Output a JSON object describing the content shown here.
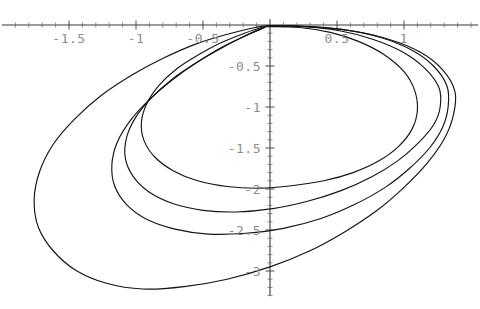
{
  "figure": {
    "width": 480,
    "height": 309,
    "background": "#ffffff",
    "curve_color": "#141414",
    "axis_color": "#3a3a3a",
    "label_color": "#8d8d8d"
  },
  "chart_data": {
    "type": "line",
    "title": "",
    "subtitle": "",
    "xlabel": "",
    "ylabel": "",
    "grid": false,
    "legend": "none",
    "axes_style": "cross-at-origin",
    "xlim": [
      -1.95,
      1.6
    ],
    "ylim": [
      -3.35,
      0.18
    ],
    "xticks": [
      -1.5,
      -1,
      -0.5,
      0.5,
      1
    ],
    "xtick_labels": [
      "-1.5",
      "-1",
      "-0.5",
      "0.5",
      "1"
    ],
    "yticks": [
      -0.5,
      -1,
      -1.5,
      -2,
      -2.5,
      -3
    ],
    "ytick_labels": [
      "-0.5",
      "-1",
      "-1.5",
      "-2",
      "-2.5",
      "-3"
    ],
    "xtick_minor_step": 0.1,
    "ytick_minor_step": 0.1,
    "origin_px": [
      270,
      25
    ],
    "px_per_x_unit": 134,
    "px_per_y_unit": 82,
    "series": [
      {
        "name": "curve-1-innermost",
        "closed": true,
        "min_y": -2.0,
        "max_y": 0.0,
        "min_x": -0.95,
        "max_x": 1.1,
        "points": [
          [
            0.0,
            -0.02
          ],
          [
            0.22,
            -0.03
          ],
          [
            0.45,
            -0.09
          ],
          [
            0.66,
            -0.2
          ],
          [
            0.85,
            -0.36
          ],
          [
            1.0,
            -0.57
          ],
          [
            1.08,
            -0.8
          ],
          [
            1.1,
            -1.04
          ],
          [
            1.06,
            -1.27
          ],
          [
            0.96,
            -1.48
          ],
          [
            0.81,
            -1.66
          ],
          [
            0.62,
            -1.8
          ],
          [
            0.4,
            -1.9
          ],
          [
            0.16,
            -1.96
          ],
          [
            -0.08,
            -1.99
          ],
          [
            -0.32,
            -1.97
          ],
          [
            -0.54,
            -1.9
          ],
          [
            -0.72,
            -1.78
          ],
          [
            -0.86,
            -1.61
          ],
          [
            -0.94,
            -1.41
          ],
          [
            -0.96,
            -1.19
          ],
          [
            -0.92,
            -0.96
          ],
          [
            -0.83,
            -0.74
          ],
          [
            -0.7,
            -0.54
          ],
          [
            -0.54,
            -0.37
          ],
          [
            -0.37,
            -0.22
          ],
          [
            -0.19,
            -0.1
          ],
          [
            -0.06,
            -0.03
          ],
          [
            0.0,
            -0.02
          ]
        ]
      },
      {
        "name": "curve-2",
        "closed": true,
        "min_y": -2.28,
        "max_y": 0.0,
        "min_x": -1.08,
        "max_x": 1.27,
        "points": [
          [
            0.0,
            -0.01
          ],
          [
            0.26,
            -0.02
          ],
          [
            0.52,
            -0.07
          ],
          [
            0.76,
            -0.17
          ],
          [
            0.98,
            -0.32
          ],
          [
            1.15,
            -0.52
          ],
          [
            1.26,
            -0.76
          ],
          [
            1.27,
            -1.0
          ],
          [
            1.22,
            -1.22
          ],
          [
            1.1,
            -1.45
          ],
          [
            0.95,
            -1.66
          ],
          [
            0.76,
            -1.85
          ],
          [
            0.53,
            -2.02
          ],
          [
            0.28,
            -2.15
          ],
          [
            0.02,
            -2.24
          ],
          [
            -0.25,
            -2.28
          ],
          [
            -0.5,
            -2.26
          ],
          [
            -0.72,
            -2.18
          ],
          [
            -0.9,
            -2.04
          ],
          [
            -1.02,
            -1.85
          ],
          [
            -1.08,
            -1.62
          ],
          [
            -1.07,
            -1.37
          ],
          [
            -1.0,
            -1.12
          ],
          [
            -0.88,
            -0.88
          ],
          [
            -0.73,
            -0.66
          ],
          [
            -0.55,
            -0.46
          ],
          [
            -0.37,
            -0.28
          ],
          [
            -0.18,
            -0.13
          ],
          [
            -0.05,
            -0.04
          ],
          [
            0.0,
            -0.01
          ]
        ]
      },
      {
        "name": "curve-3",
        "closed": true,
        "min_y": -2.55,
        "max_y": 0.0,
        "min_x": -1.18,
        "max_x": 1.33,
        "points": [
          [
            0.0,
            -0.01
          ],
          [
            0.28,
            -0.02
          ],
          [
            0.56,
            -0.06
          ],
          [
            0.82,
            -0.15
          ],
          [
            1.05,
            -0.3
          ],
          [
            1.22,
            -0.5
          ],
          [
            1.32,
            -0.74
          ],
          [
            1.33,
            -0.99
          ],
          [
            1.29,
            -1.24
          ],
          [
            1.19,
            -1.5
          ],
          [
            1.04,
            -1.75
          ],
          [
            0.86,
            -1.98
          ],
          [
            0.63,
            -2.19
          ],
          [
            0.38,
            -2.36
          ],
          [
            0.1,
            -2.48
          ],
          [
            -0.18,
            -2.54
          ],
          [
            -0.46,
            -2.55
          ],
          [
            -0.71,
            -2.49
          ],
          [
            -0.92,
            -2.37
          ],
          [
            -1.07,
            -2.19
          ],
          [
            -1.16,
            -1.96
          ],
          [
            -1.18,
            -1.7
          ],
          [
            -1.14,
            -1.43
          ],
          [
            -1.04,
            -1.16
          ],
          [
            -0.9,
            -0.91
          ],
          [
            -0.73,
            -0.67
          ],
          [
            -0.55,
            -0.46
          ],
          [
            -0.36,
            -0.28
          ],
          [
            -0.17,
            -0.12
          ],
          [
            -0.05,
            -0.03
          ],
          [
            0.0,
            -0.01
          ]
        ]
      },
      {
        "name": "curve-4-outermost",
        "closed": true,
        "min_y": -3.22,
        "max_y": 0.0,
        "min_x": -1.76,
        "max_x": 1.38,
        "points": [
          [
            0.0,
            -0.01
          ],
          [
            0.3,
            -0.02
          ],
          [
            0.6,
            -0.07
          ],
          [
            0.88,
            -0.17
          ],
          [
            1.12,
            -0.33
          ],
          [
            1.29,
            -0.55
          ],
          [
            1.38,
            -0.81
          ],
          [
            1.37,
            -1.09
          ],
          [
            1.3,
            -1.39
          ],
          [
            1.17,
            -1.69
          ],
          [
            1.0,
            -1.98
          ],
          [
            0.8,
            -2.26
          ],
          [
            0.56,
            -2.52
          ],
          [
            0.29,
            -2.76
          ],
          [
            0.0,
            -2.95
          ],
          [
            -0.32,
            -3.1
          ],
          [
            -0.64,
            -3.19
          ],
          [
            -0.95,
            -3.22
          ],
          [
            -1.22,
            -3.15
          ],
          [
            -1.45,
            -2.99
          ],
          [
            -1.62,
            -2.75
          ],
          [
            -1.73,
            -2.46
          ],
          [
            -1.76,
            -2.13
          ],
          [
            -1.72,
            -1.79
          ],
          [
            -1.62,
            -1.46
          ],
          [
            -1.46,
            -1.15
          ],
          [
            -1.26,
            -0.86
          ],
          [
            -1.03,
            -0.61
          ],
          [
            -0.79,
            -0.4
          ],
          [
            -0.55,
            -0.23
          ],
          [
            -0.31,
            -0.11
          ],
          [
            -0.11,
            -0.03
          ],
          [
            0.0,
            -0.01
          ]
        ]
      }
    ]
  }
}
